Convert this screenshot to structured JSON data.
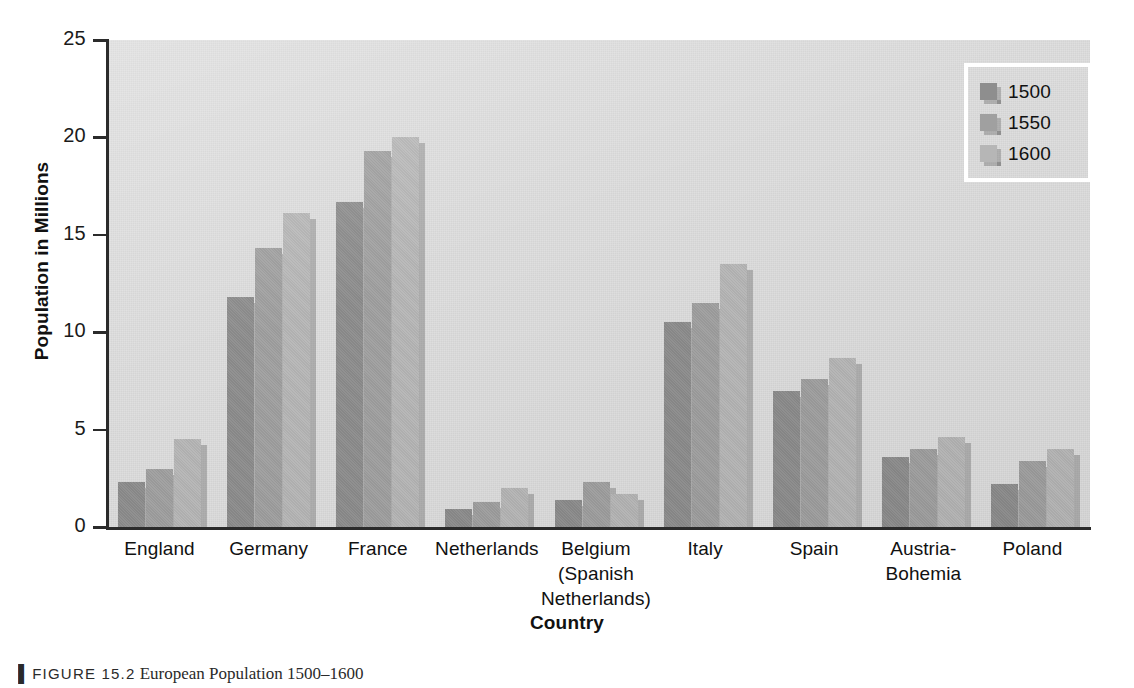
{
  "figure": {
    "caption_marker": "▌",
    "caption_figure_number": "FIGURE 15.2",
    "caption_text": "European Population 1500–1600"
  },
  "axes": {
    "y_title": "Population in Millions",
    "x_title": "Country",
    "y_ticks": [
      "0",
      "5",
      "10",
      "15",
      "20",
      "25"
    ]
  },
  "legend": {
    "entries": [
      {
        "label": "1500",
        "color": "#8e8e8e"
      },
      {
        "label": "1550",
        "color": "#a0a0a0"
      },
      {
        "label": "1600",
        "color": "#b6b6b6"
      }
    ]
  },
  "chart_data": {
    "type": "bar",
    "title": "European Population 1500–1600",
    "xlabel": "Country",
    "ylabel": "Population in Millions",
    "ylim": [
      0,
      25
    ],
    "yticks": [
      0,
      5,
      10,
      15,
      20,
      25
    ],
    "grid": false,
    "legend_position": "top-right",
    "categories": [
      "England",
      "Germany",
      "France",
      "Netherlands",
      "Belgium (Spanish Netherlands)",
      "Italy",
      "Spain",
      "Austria-Bohemia",
      "Poland"
    ],
    "category_labels_display": [
      "England",
      "Germany",
      "France",
      "Netherlands",
      "Belgium\n(Spanish\nNetherlands)",
      "Italy",
      "Spain",
      "Austria-\nBohemia",
      "Poland"
    ],
    "series": [
      {
        "name": "1500",
        "color": "#8e8e8e",
        "values": [
          2.3,
          11.8,
          16.7,
          0.9,
          1.4,
          10.5,
          7.0,
          3.6,
          2.2
        ]
      },
      {
        "name": "1550",
        "color": "#a0a0a0",
        "values": [
          3.0,
          14.3,
          19.3,
          1.3,
          2.3,
          11.5,
          7.6,
          4.0,
          3.4
        ]
      },
      {
        "name": "1600",
        "color": "#b6b6b6",
        "values": [
          4.5,
          16.1,
          20.0,
          2.0,
          1.7,
          13.5,
          8.7,
          4.6,
          4.0
        ]
      }
    ]
  }
}
